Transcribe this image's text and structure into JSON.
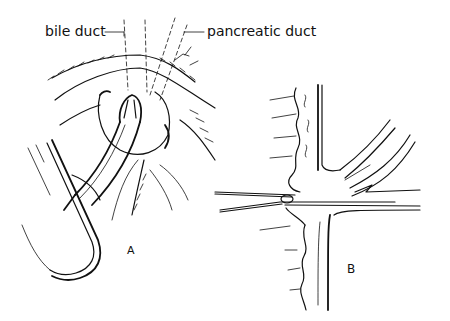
{
  "figure": {
    "panel_a": {
      "label": "A",
      "annotations": {
        "bile_duct": "bile duct",
        "pancreatic_duct": "pancreatic duct"
      }
    },
    "panel_b": {
      "label": "B"
    }
  },
  "colors": {
    "ink": "#111111",
    "background": "#ffffff"
  }
}
